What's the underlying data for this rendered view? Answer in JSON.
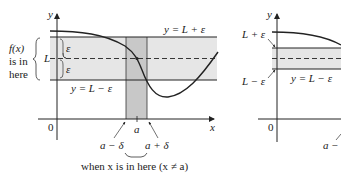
{
  "left_diagram": {
    "y_axis_label": "y",
    "x_axis_label": "x",
    "origin_label": "0",
    "upper_line_label": "y = L + ε",
    "lower_line_label": "y = L − ε",
    "L_label": "L",
    "epsilon_upper": "ε",
    "epsilon_lower": "ε",
    "fx_label_line1": "f(x)",
    "fx_label_line2": "is in",
    "fx_label_line3": "here",
    "a_label": "a",
    "a_minus_delta": "a − δ",
    "a_plus_delta": "a + δ",
    "caption": "when x is in here (x ≠ a)"
  },
  "right_diagram": {
    "y_axis_label": "y",
    "origin_label": "0",
    "upper_label": "L + ε",
    "lower_label": "L − ε",
    "lower_line_label": "y = L − ε",
    "a_minus_partial": "a −"
  },
  "colors": {
    "band_fill": "#e6e6e6",
    "strip_fill": "#c8c8c8",
    "line": "#222222"
  }
}
